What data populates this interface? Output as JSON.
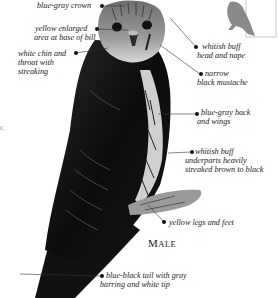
{
  "figure": {
    "caption": "Male",
    "caption_first": "M",
    "caption_rest": "ALE",
    "edge_text": "c",
    "labels": [
      {
        "id": "crown",
        "lines": [
          "blue-gray crown"
        ]
      },
      {
        "id": "bill",
        "lines": [
          "yellow enlarged",
          "area at base of bill"
        ]
      },
      {
        "id": "chin",
        "lines": [
          "white chin and",
          "throat with",
          "streaking"
        ]
      },
      {
        "id": "head",
        "lines": [
          "whitish buff",
          "head and nape"
        ]
      },
      {
        "id": "mustache",
        "lines": [
          "narrow",
          "black mustache"
        ]
      },
      {
        "id": "back",
        "lines": [
          "blue-gray back",
          "and wings"
        ]
      },
      {
        "id": "underparts",
        "lines": [
          "whitish buff",
          "underparts heavily",
          "streaked brown to black"
        ]
      },
      {
        "id": "legs",
        "lines": [
          "yellow legs and feet"
        ]
      },
      {
        "id": "tail",
        "lines": [
          "blue-black tail with gray",
          "barring and white tip"
        ]
      }
    ]
  },
  "colors": {
    "background": "#ffffff",
    "text": "#222222",
    "bird_dark": "#111111",
    "bird_mid": "#555555",
    "silhouette": "#8a8a8a",
    "leader": "#333333"
  }
}
